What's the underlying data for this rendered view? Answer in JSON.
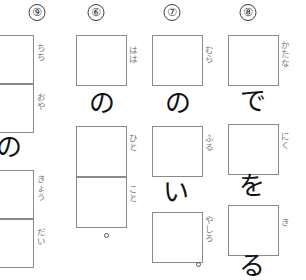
{
  "sheet": {
    "title": "Japanese kanji writing practice sheet",
    "writing_direction": "vertical-rtl",
    "background_color": "#ffffff",
    "box_border_color": "#8a8a8a",
    "furigana_color": "#787878",
    "kana_ink_color": "#111111"
  },
  "columns": [
    {
      "number": "⑧",
      "number_plain": "7",
      "items": [
        {
          "type": "box",
          "furigana": [
            "か",
            "た",
            "な"
          ]
        },
        {
          "type": "kana",
          "text": "で"
        },
        {
          "type": "box",
          "furigana": [
            "に",
            "く"
          ]
        },
        {
          "type": "kana",
          "text": "を"
        },
        {
          "type": "box",
          "furigana": [
            "き"
          ]
        },
        {
          "type": "kana",
          "text": "る"
        }
      ]
    },
    {
      "number": "⑦",
      "number_plain": "8",
      "items": [
        {
          "type": "box",
          "furigana": [
            "む",
            "ら"
          ]
        },
        {
          "type": "kana",
          "text": "の"
        },
        {
          "type": "box",
          "furigana": [
            "ふ",
            "る"
          ]
        },
        {
          "type": "kana",
          "text": "い"
        },
        {
          "type": "box",
          "furigana": [
            "や",
            "し",
            "ろ"
          ]
        },
        {
          "type": "maru",
          "text": "。"
        }
      ]
    },
    {
      "number": "⑥",
      "number_plain": "9",
      "items": [
        {
          "type": "box",
          "furigana": [
            "は",
            "は"
          ]
        },
        {
          "type": "kana",
          "text": "の"
        },
        {
          "type": "box",
          "furigana": [
            "ひ",
            "と"
          ]
        },
        {
          "type": "box",
          "furigana": [
            "こ",
            "と"
          ]
        },
        {
          "type": "maru",
          "text": "。"
        }
      ]
    },
    {
      "number": "⑨",
      "number_plain": "10",
      "items": [
        {
          "type": "box",
          "furigana": [
            "ち",
            "ち"
          ]
        },
        {
          "type": "box",
          "furigana": [
            "お",
            "や"
          ]
        },
        {
          "type": "kana",
          "text": "の"
        },
        {
          "type": "box",
          "furigana": [
            "き",
            "ょ",
            "う"
          ]
        },
        {
          "type": "box",
          "furigana": [
            "だ",
            "い"
          ]
        }
      ]
    }
  ]
}
